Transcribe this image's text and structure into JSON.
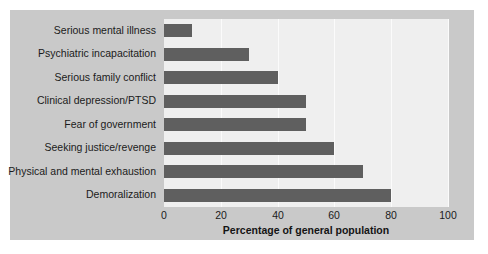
{
  "chart_data": {
    "type": "bar",
    "orientation": "horizontal",
    "title": "",
    "xlabel": "Percentage of general population",
    "ylabel": "",
    "categories": [
      "Serious mental illness",
      "Psychiatric incapacitation",
      "Serious family conflict",
      "Clinical depression/PTSD",
      "Fear of government",
      "Seeking justice/revenge",
      "Physical and mental exhaustion",
      "Demoralization"
    ],
    "values": [
      10,
      30,
      40,
      50,
      50,
      60,
      70,
      80
    ],
    "xlim": [
      0,
      100
    ],
    "xticks": [
      0,
      20,
      40,
      60,
      80,
      100
    ],
    "xtick_labels": [
      "0",
      "20",
      "40",
      "60",
      "80",
      "100"
    ],
    "grid": true,
    "grid_axis": "x",
    "legend": false,
    "bar_color": "#5f5f5f",
    "plot_background": "#efefef",
    "panel_background": "#c9c9c9",
    "gridline_color": "#fbfbfb",
    "figure_background": "#ffffff"
  }
}
